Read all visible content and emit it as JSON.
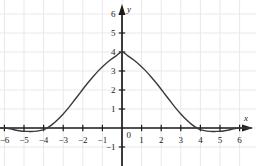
{
  "figure": {
    "width": 256,
    "height": 166,
    "background_color": "#ffffff"
  },
  "chart_data": {
    "type": "line",
    "title": "",
    "subtitle": "",
    "xlabel": "x",
    "ylabel": "y",
    "xlim": [
      -6.6,
      6.7
    ],
    "ylim": [
      -1.6,
      6.6
    ],
    "xticks": [
      -6,
      -5,
      -4,
      -3,
      -2,
      -1,
      1,
      2,
      3,
      4,
      5,
      6
    ],
    "yticks": [
      -1,
      1,
      2,
      3,
      4,
      5,
      6
    ],
    "xtick_labels": [
      "−6",
      "−5",
      "−4",
      "−3",
      "−2",
      "−1",
      "1",
      "2",
      "3",
      "4",
      "5",
      "6"
    ],
    "ytick_labels": [
      "−1",
      "1",
      "2",
      "3",
      "4",
      "5",
      "6"
    ],
    "origin_label": "0",
    "grid": true,
    "grid_color": "#e9e9ec",
    "grid_spacing": 1,
    "axis_color": "#1b1b1b",
    "legend": null,
    "series": [
      {
        "name": "curve",
        "color": "#3a3a3a",
        "line_width": 1.4,
        "peak": {
          "x": 0,
          "y": 4
        },
        "zeros": [
          -4,
          4
        ],
        "minima": [
          {
            "x": -4.5,
            "y": -0.18
          },
          {
            "x": 4.5,
            "y": -0.18
          }
        ],
        "x": [
          -6.6,
          -6.3,
          -6.0,
          -5.7,
          -5.4,
          -5.1,
          -4.8,
          -4.5,
          -4.2,
          -3.9,
          -3.6,
          -3.3,
          -3.0,
          -2.7,
          -2.4,
          -2.1,
          -1.8,
          -1.5,
          -1.2,
          -0.9,
          -0.6,
          -0.3,
          0.0,
          0.3,
          0.6,
          0.9,
          1.2,
          1.5,
          1.8,
          2.1,
          2.4,
          2.7,
          3.0,
          3.3,
          3.6,
          3.9,
          4.2,
          4.5,
          4.8,
          5.1,
          5.4,
          5.7,
          6.0,
          6.3,
          6.6
        ],
        "y": [
          0.0,
          0.0,
          0.0,
          -0.04,
          -0.12,
          -0.17,
          -0.18,
          -0.18,
          -0.14,
          -0.04,
          0.15,
          0.42,
          0.74,
          1.1,
          1.5,
          1.9,
          2.3,
          2.67,
          3.02,
          3.32,
          3.58,
          3.8,
          4.0,
          3.8,
          3.58,
          3.32,
          3.02,
          2.67,
          2.3,
          1.9,
          1.5,
          1.1,
          0.74,
          0.42,
          0.15,
          -0.04,
          -0.14,
          -0.18,
          -0.18,
          -0.17,
          -0.12,
          -0.04,
          0.0,
          0.0,
          0.0
        ]
      }
    ]
  }
}
